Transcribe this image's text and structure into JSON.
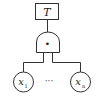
{
  "diagram": {
    "type": "fault-tree",
    "top_event": {
      "label": "T"
    },
    "gate": {
      "type": "AND",
      "symbol": "•"
    },
    "basic_events": [
      {
        "label": "x",
        "subscript": "1"
      },
      {
        "label": "x",
        "subscript": "n"
      }
    ],
    "ellipsis": "···"
  }
}
